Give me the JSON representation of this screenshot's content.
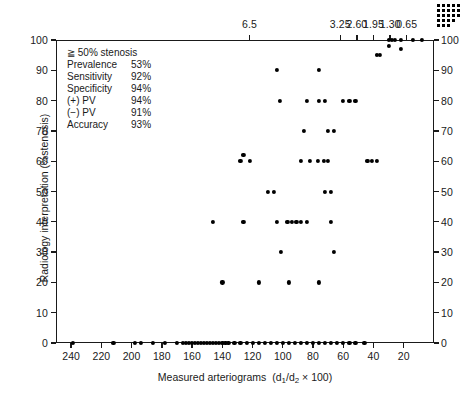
{
  "chart_data": {
    "type": "scatter",
    "title": "",
    "xlabel": "Measured arteriograms  (d1/d2 x 100)",
    "ylabel": "Radiology interpretation (%stenosis)",
    "xlim": [
      250,
      0
    ],
    "ylim": [
      0,
      100
    ],
    "x_axis_reversed": true,
    "grid": false,
    "legend_position": "none",
    "x_ticks": [
      240,
      220,
      200,
      180,
      160,
      140,
      120,
      100,
      80,
      60,
      40,
      20
    ],
    "x_tick_labels": [
      "240",
      "220",
      "200",
      "180",
      "160",
      "140",
      "120",
      "100",
      "80",
      "60",
      "40",
      "20"
    ],
    "y_ticks": [
      0,
      10,
      20,
      30,
      40,
      50,
      60,
      70,
      80,
      90,
      100
    ],
    "y_tick_labels": [
      "0",
      "10",
      "20",
      "30",
      "40",
      "50",
      "60",
      "70",
      "80",
      "90",
      "100"
    ],
    "y_ticks_right": [
      0,
      10,
      20,
      30,
      40,
      50,
      60,
      70,
      80,
      90,
      100
    ],
    "y_tick_labels_right": [
      "0",
      "10",
      "20",
      "30",
      "40",
      "50",
      "60",
      "70",
      "80",
      "90",
      "100"
    ],
    "top_axis": {
      "label": "",
      "tick_positions_x": [
        122,
        62,
        51,
        40,
        29,
        18
      ],
      "tick_labels": [
        "6.5",
        "3.25",
        "2.60",
        "1.95",
        "1.30",
        "0.65"
      ]
    },
    "points": [
      [
        239,
        0
      ],
      [
        212,
        0
      ],
      [
        198,
        0
      ],
      [
        194,
        0
      ],
      [
        186,
        0
      ],
      [
        178,
        0
      ],
      [
        170,
        0
      ],
      [
        166,
        0
      ],
      [
        164,
        0
      ],
      [
        162,
        0
      ],
      [
        160,
        0
      ],
      [
        158,
        0
      ],
      [
        156,
        0
      ],
      [
        154,
        0
      ],
      [
        152,
        0
      ],
      [
        150,
        0
      ],
      [
        148,
        0
      ],
      [
        146,
        0
      ],
      [
        144,
        0
      ],
      [
        142,
        0
      ],
      [
        140,
        0
      ],
      [
        138,
        0
      ],
      [
        136,
        0
      ],
      [
        132,
        0
      ],
      [
        128,
        0
      ],
      [
        124,
        0
      ],
      [
        120,
        0
      ],
      [
        116,
        0
      ],
      [
        112,
        0
      ],
      [
        108,
        0
      ],
      [
        104,
        0
      ],
      [
        100,
        0
      ],
      [
        96,
        0
      ],
      [
        92,
        0
      ],
      [
        88,
        0
      ],
      [
        84,
        0
      ],
      [
        80,
        0
      ],
      [
        76,
        0
      ],
      [
        72,
        0
      ],
      [
        68,
        0
      ],
      [
        64,
        0
      ],
      [
        60,
        0
      ],
      [
        56,
        0
      ],
      [
        52,
        0
      ],
      [
        46,
        0
      ],
      [
        140,
        20
      ],
      [
        116,
        20
      ],
      [
        96,
        20
      ],
      [
        76,
        20
      ],
      [
        66,
        30
      ],
      [
        101,
        30
      ],
      [
        126,
        40
      ],
      [
        104,
        40
      ],
      [
        97,
        40
      ],
      [
        94,
        40
      ],
      [
        91,
        40
      ],
      [
        88,
        40
      ],
      [
        84,
        40
      ],
      [
        68,
        40
      ],
      [
        146,
        40
      ],
      [
        72,
        50
      ],
      [
        68,
        50
      ],
      [
        110,
        50
      ],
      [
        106,
        50
      ],
      [
        128,
        60
      ],
      [
        122,
        60
      ],
      [
        88,
        60
      ],
      [
        82,
        60
      ],
      [
        77,
        60
      ],
      [
        73,
        60
      ],
      [
        70,
        60
      ],
      [
        44,
        60
      ],
      [
        41,
        60
      ],
      [
        38,
        60
      ],
      [
        126,
        62
      ],
      [
        86,
        70
      ],
      [
        70,
        70
      ],
      [
        66,
        70
      ],
      [
        102,
        80
      ],
      [
        84,
        80
      ],
      [
        76,
        80
      ],
      [
        72,
        80
      ],
      [
        60,
        80
      ],
      [
        56,
        80
      ],
      [
        52,
        80
      ],
      [
        104,
        90
      ],
      [
        76,
        90
      ],
      [
        38,
        95
      ],
      [
        36,
        95
      ],
      [
        30,
        100
      ],
      [
        28,
        100
      ],
      [
        26,
        100
      ],
      [
        22,
        100
      ],
      [
        14,
        100
      ],
      [
        8,
        100
      ],
      [
        30,
        98
      ],
      [
        22,
        97
      ]
    ]
  },
  "stats": {
    "heading": "≧ 50% stenosis",
    "rows": [
      {
        "label": "Prevalence",
        "value": "53%"
      },
      {
        "label": "Sensitivity",
        "value": "92%"
      },
      {
        "label": "Specificity",
        "value": "94%"
      },
      {
        "label": "(+) PV",
        "value": "94%"
      },
      {
        "label": "(−) PV",
        "value": "91%"
      },
      {
        "label": "Accuracy",
        "value": "93%"
      }
    ]
  },
  "axis_titles": {
    "x_main": "Measured arteriograms",
    "x_paren_open": "(d",
    "x_sub1": "1",
    "x_slash": "/d",
    "x_sub2": "2",
    "x_tail": " × 100)",
    "y": "Radiology interpretation (%stenosis)"
  },
  "colors": {
    "axis": "#1a1a1a",
    "marker": "#000000",
    "background": "#ffffff"
  }
}
